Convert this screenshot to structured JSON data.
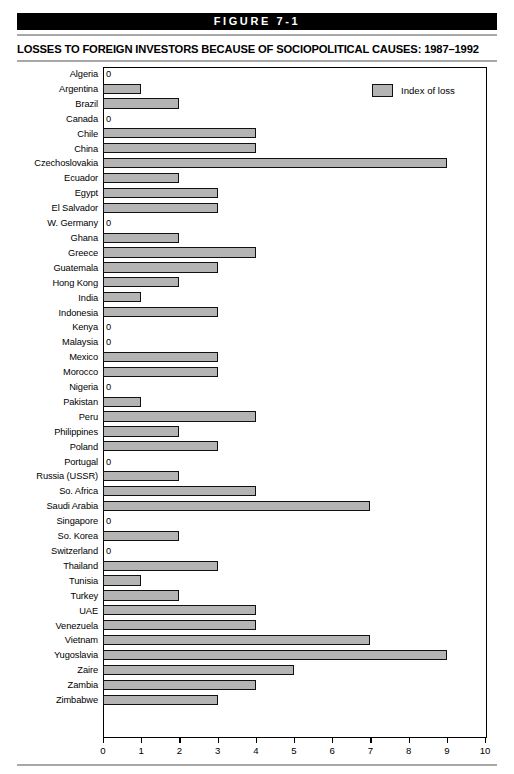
{
  "header": {
    "figure_label": "FIGURE 7-1",
    "title": "LOSSES TO FOREIGN INVESTORS BECAUSE OF SOCIOPOLITICAL CAUSES: 1987–1992"
  },
  "legend": {
    "label": "Index of loss",
    "swatch_color": "#b4b4b4"
  },
  "zero_text": "0",
  "chart_data": {
    "type": "bar",
    "orientation": "horizontal",
    "title": "LOSSES TO FOREIGN INVESTORS BECAUSE OF SOCIOPOLITICAL CAUSES: 1987–1992",
    "xlabel": "",
    "ylabel": "",
    "xlim": [
      0,
      10
    ],
    "grid": false,
    "legend_position": "top-right",
    "series": [
      {
        "name": "Index of loss",
        "color": "#b4b4b4",
        "values": [
          0,
          1,
          2,
          0,
          4,
          4,
          9,
          2,
          3,
          3,
          0,
          2,
          4,
          3,
          2,
          1,
          3,
          0,
          0,
          3,
          3,
          0,
          1,
          4,
          2,
          3,
          0,
          2,
          4,
          7,
          0,
          2,
          0,
          3,
          1,
          2,
          4,
          4,
          7,
          9,
          5,
          4,
          3
        ]
      }
    ],
    "categories": [
      "Algeria",
      "Argentina",
      "Brazil",
      "Canada",
      "Chile",
      "China",
      "Czechoslovakia",
      "Ecuador",
      "Egypt",
      "El Salvador",
      "W. Germany",
      "Ghana",
      "Greece",
      "Guatemala",
      "Hong Kong",
      "India",
      "Indonesia",
      "Kenya",
      "Malaysia",
      "Mexico",
      "Morocco",
      "Nigeria",
      "Pakistan",
      "Peru",
      "Philippines",
      "Poland",
      "Portugal",
      "Russia (USSR)",
      "So. Africa",
      "Saudi Arabia",
      "Singapore",
      "So. Korea",
      "Switzerland",
      "Thailand",
      "Tunisia",
      "Turkey",
      "UAE",
      "Venezuela",
      "Vietnam",
      "Yugoslavia",
      "Zaire",
      "Zambia",
      "Zimbabwe"
    ],
    "xticks": [
      0,
      1,
      2,
      3,
      4,
      5,
      6,
      7,
      8,
      9,
      10
    ],
    "xtick_labels": [
      "0",
      "1",
      "2",
      "3",
      "4",
      "5",
      "6",
      "7",
      "8",
      "9",
      "10"
    ]
  }
}
